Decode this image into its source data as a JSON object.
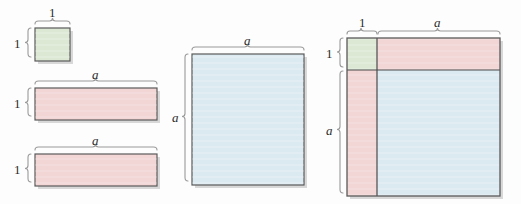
{
  "figure": {
    "background_color": "#fdfdfd",
    "colors": {
      "green_fill": "#dce8d4",
      "pink_fill": "#f2d5d5",
      "blue_fill": "#dbeaf0",
      "outline": "#5a5a5a",
      "inner_line": "#4a4a4a",
      "brace": "#9a9a9a",
      "shadow": "#b9b9b9",
      "label_text": "#2b2b2b"
    }
  },
  "panels": [
    {
      "id": "unit-square",
      "name": "unit-square-panel",
      "shape": "square",
      "fill": "#dce8d4",
      "x": 35,
      "y": 28,
      "width": 35,
      "height": 33,
      "labels": [
        {
          "id": "top",
          "text": "1",
          "italic": false,
          "side": "top"
        },
        {
          "id": "left",
          "text": "1",
          "italic": false,
          "side": "left"
        }
      ]
    },
    {
      "id": "rect-one-a-top",
      "name": "rect-1-by-a-top-panel",
      "shape": "rectangle",
      "fill": "#f2d5d5",
      "x": 35,
      "y": 88,
      "width": 122,
      "height": 32,
      "labels": [
        {
          "id": "top",
          "text": "a",
          "italic": true,
          "side": "top"
        },
        {
          "id": "left",
          "text": "1",
          "italic": false,
          "side": "left"
        }
      ]
    },
    {
      "id": "rect-one-a-bottom",
      "name": "rect-1-by-a-bottom-panel",
      "shape": "rectangle",
      "fill": "#f2d5d5",
      "x": 35,
      "y": 154,
      "width": 122,
      "height": 32,
      "labels": [
        {
          "id": "top",
          "text": "a",
          "italic": true,
          "side": "top"
        },
        {
          "id": "left",
          "text": "1",
          "italic": false,
          "side": "left"
        }
      ]
    },
    {
      "id": "square-a",
      "name": "square-a-by-a-panel",
      "shape": "square",
      "fill": "#dbeaf0",
      "x": 192,
      "y": 54,
      "width": 112,
      "height": 131,
      "labels": [
        {
          "id": "top",
          "text": "a",
          "italic": true,
          "side": "top"
        },
        {
          "id": "left",
          "text": "a",
          "italic": true,
          "side": "left"
        }
      ]
    },
    {
      "id": "composite",
      "name": "composite-square-panel",
      "shape": "composite-square",
      "x": 347,
      "y": 38,
      "width": 153,
      "height": 158,
      "split_x": 377,
      "split_y": 70,
      "regions": [
        {
          "id": "green",
          "name": "composite-unit-square-region",
          "fill": "#dce8d4"
        },
        {
          "id": "pink-top",
          "name": "composite-top-rectangle-region",
          "fill": "#f2d5d5"
        },
        {
          "id": "pink-left",
          "name": "composite-left-rectangle-region",
          "fill": "#f2d5d5"
        },
        {
          "id": "blue",
          "name": "composite-a-square-region",
          "fill": "#dbeaf0"
        }
      ],
      "labels": [
        {
          "id": "top-1",
          "text": "1",
          "italic": false,
          "side": "top"
        },
        {
          "id": "top-a",
          "text": "a",
          "italic": true,
          "side": "top"
        },
        {
          "id": "left-1",
          "text": "1",
          "italic": false,
          "side": "left"
        },
        {
          "id": "left-a",
          "text": "a",
          "italic": true,
          "side": "left"
        }
      ]
    }
  ],
  "labels": {
    "unit_top": "1",
    "unit_left": "1",
    "rect_top_a_1": "a",
    "rect_top_left_1": "1",
    "rect_bottom_a": "a",
    "rect_bottom_left_1": "1",
    "square_top_a": "a",
    "square_left_a": "a",
    "composite_top_1": "1",
    "composite_top_a": "a",
    "composite_left_1": "1",
    "composite_left_a": "a"
  }
}
